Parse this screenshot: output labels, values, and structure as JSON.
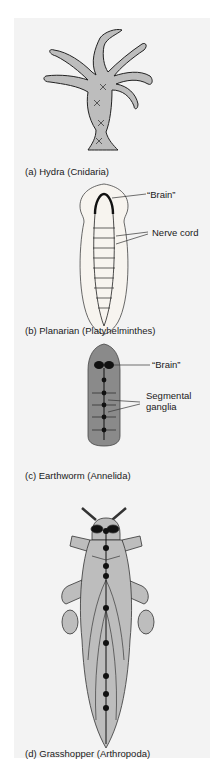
{
  "figure": {
    "panels": [
      {
        "id": "a",
        "caption": "(a) Hydra (Cnidaria)",
        "callouts": []
      },
      {
        "id": "b",
        "caption": "(b) Planarian (Platyhelminthes)",
        "callouts": [
          "“Brain”",
          "Nerve cord"
        ]
      },
      {
        "id": "c",
        "caption": "(c) Earthworm (Annelida)",
        "callouts": [
          "“Brain”",
          "Segmental",
          "ganglia"
        ]
      },
      {
        "id": "d",
        "caption": "(d) Grasshopper (Arthropoda)",
        "callouts": []
      }
    ]
  }
}
